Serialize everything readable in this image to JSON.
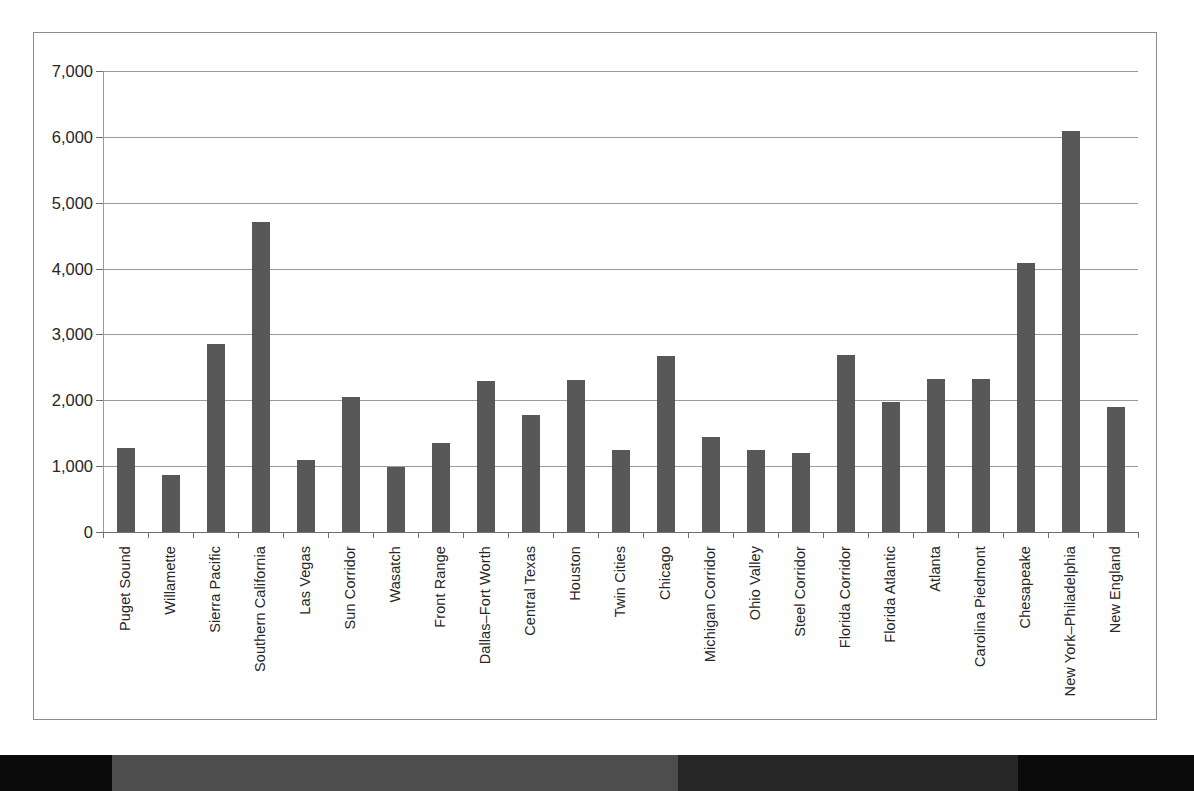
{
  "chart_data": {
    "type": "bar",
    "title": "",
    "subtitle": "",
    "xlabel": "",
    "ylabel": "",
    "ylim": [
      0,
      7000
    ],
    "grid": true,
    "legend": "none",
    "bar_color": "#585858",
    "categories": [
      "Puget Sound",
      "Willamette",
      "Sierra Pacific",
      "Southern California",
      "Las Vegas",
      "Sun Corridor",
      "Wasatch",
      "Front Range",
      "Dallas–Fort Worth",
      "Central Texas",
      "Houston",
      "Twin Cities",
      "Chicago",
      "Michigan Corridor",
      "Ohio Valley",
      "Steel Corridor",
      "Florida Corridor",
      "Florida Atlantic",
      "Atlanta",
      "Carolina Piedmont",
      "Chesapeake",
      "New York–Philadelphia",
      "New England"
    ],
    "values": [
      1280,
      870,
      2860,
      4710,
      1090,
      2050,
      990,
      1350,
      2300,
      1770,
      2310,
      1240,
      2670,
      1440,
      1250,
      1200,
      2690,
      1980,
      2330,
      2330,
      4080,
      6090,
      1900
    ],
    "ytick_labels": [
      "0",
      "1,000",
      "2,000",
      "3,000",
      "4,000",
      "5,000",
      "6,000",
      "7,000"
    ],
    "ytick_values": [
      0,
      1000,
      2000,
      3000,
      4000,
      5000,
      6000,
      7000
    ]
  },
  "figure": {
    "border_color": "#8c8c8c",
    "gridline_color": "#9a9a9a",
    "axis_color": "#6f6f6f",
    "text_color": "#262626"
  }
}
